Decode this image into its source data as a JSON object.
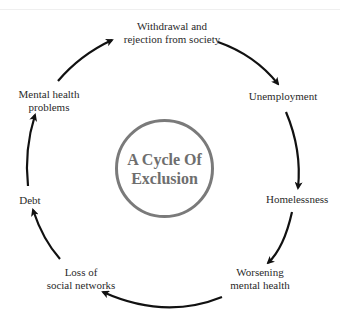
{
  "diagram": {
    "title_line1": "A Cycle Of",
    "title_line2": "Exclusion",
    "nodes": [
      {
        "line1": "Withdrawal and",
        "line2": "rejection from society"
      },
      {
        "line1": "Unemployment",
        "line2": ""
      },
      {
        "line1": "Homelessness",
        "line2": ""
      },
      {
        "line1": "Worsening",
        "line2": "mental health"
      },
      {
        "line1": "Loss of",
        "line2": "social networks"
      },
      {
        "line1": "Debt",
        "line2": ""
      },
      {
        "line1": "Mental health",
        "line2": "problems"
      }
    ],
    "colors": {
      "arrow": "#111111",
      "circle": "#7a7a7a",
      "title": "#6e6e6e"
    }
  }
}
